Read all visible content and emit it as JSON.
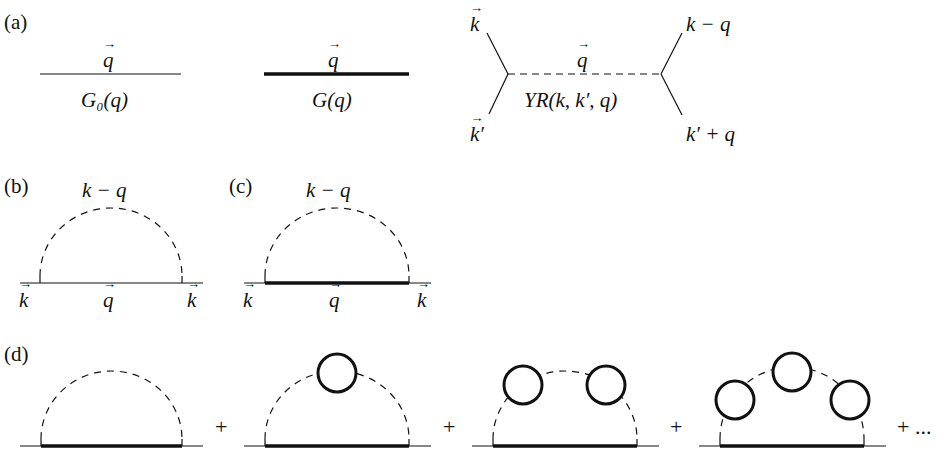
{
  "panels": {
    "a": {
      "label": "(a)",
      "bare_propagator": {
        "momentum": "q",
        "name": "G₀(q)"
      },
      "dressed_propagator": {
        "momentum": "q",
        "name": "G(q)"
      },
      "vertex": {
        "top_left": "k",
        "bottom_left": "k′",
        "top_right": "k − q",
        "bottom_right": "k′ + q",
        "line_momentum": "q",
        "coupling": "YR(k, k′, q)"
      }
    },
    "b": {
      "label": "(b)",
      "arc": "k − q",
      "line": "q",
      "left": "k",
      "right": "k"
    },
    "c": {
      "label": "(c)",
      "arc": "k − q",
      "line": "q",
      "left": "k",
      "right": "k"
    },
    "d": {
      "label": "(d)",
      "plus": "+",
      "ellipsis": "+ ...",
      "bubble_counts": [
        0,
        1,
        2,
        3
      ]
    }
  },
  "colors": {
    "ink": "#111111",
    "background": "#ffffff"
  }
}
